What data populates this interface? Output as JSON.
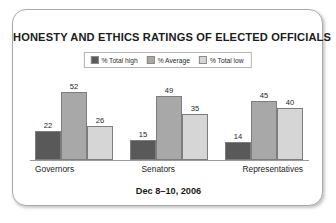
{
  "card": {
    "title": "HONESTY AND ETHICS RATINGS OF ELECTED OFFICIALS",
    "footer_date": "Dec 8–10, 2006"
  },
  "legend": {
    "items": [
      {
        "label": "% Total high",
        "color": "#595959"
      },
      {
        "label": "% Average",
        "color": "#a8a8a8"
      },
      {
        "label": "% Total low",
        "color": "#d6d6d6"
      }
    ]
  },
  "chart_data": {
    "type": "bar",
    "title": "HONESTY AND ETHICS RATINGS OF ELECTED OFFICIALS",
    "subtitle": "Dec 8–10, 2006",
    "xlabel": "",
    "ylabel": "",
    "ylim": [
      0,
      60
    ],
    "grid": false,
    "legend_position": "top-center",
    "categories": [
      "Governors",
      "Senators",
      "Representatives"
    ],
    "series": [
      {
        "name": "% Total high",
        "color": "#595959",
        "values": [
          22,
          15,
          14
        ]
      },
      {
        "name": "% Average",
        "color": "#a8a8a8",
        "values": [
          52,
          49,
          45
        ]
      },
      {
        "name": "% Total low",
        "color": "#d6d6d6",
        "values": [
          26,
          35,
          40
        ]
      }
    ]
  }
}
